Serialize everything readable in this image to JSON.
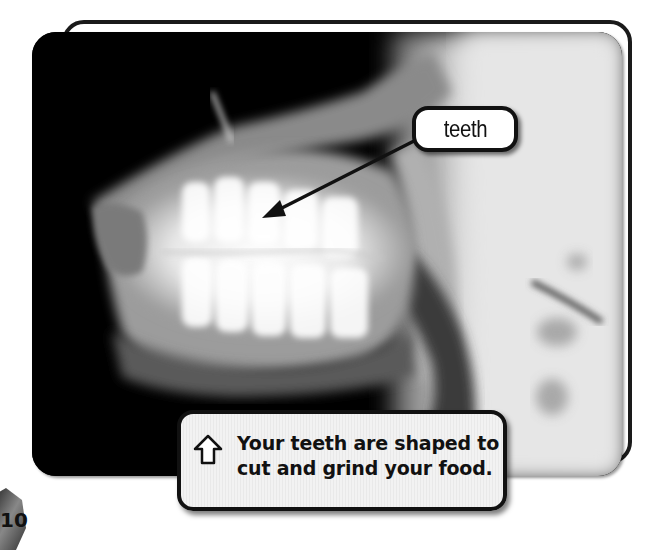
{
  "figure": {
    "label": "teeth",
    "caption_line1": "Your teeth are shaped to",
    "caption_line2": "cut and grind your food.",
    "caption_icon": "up-arrow-outline-icon"
  },
  "page": {
    "number": "10"
  },
  "colors": {
    "frame": "#1a1a1a",
    "label_bg": "#ffffff",
    "caption_bg": "#efefef",
    "text": "#111111"
  }
}
